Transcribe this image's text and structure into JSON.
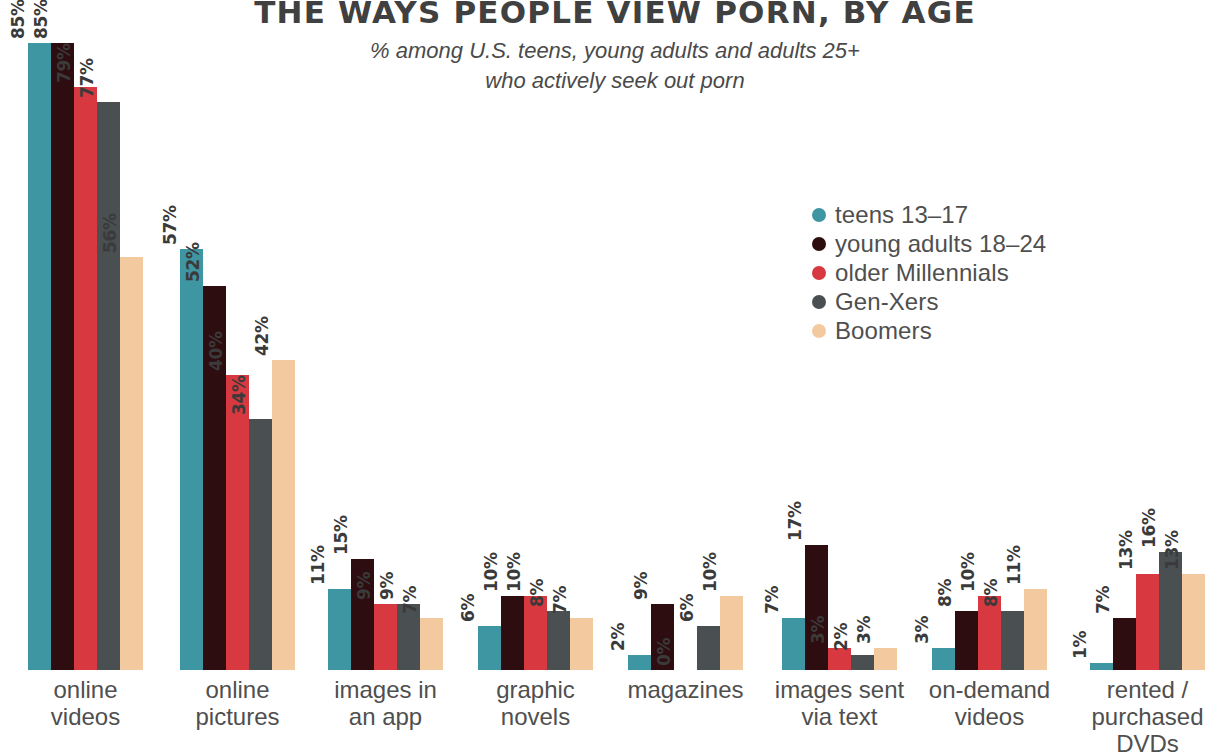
{
  "header": {
    "title": "THE WAYS PEOPLE VIEW PORN, BY AGE",
    "subtitle_line1": "% among U.S. teens, young adults and adults 25+",
    "subtitle_line2": "who actively seek out porn"
  },
  "chart_data": {
    "type": "bar",
    "title": "THE WAYS PEOPLE VIEW PORN, BY AGE",
    "subtitle": "% among U.S. teens, young adults and adults 25+ who actively seek out porn",
    "xlabel": "",
    "ylabel": "",
    "ylim": [
      0,
      85
    ],
    "grid": false,
    "legend_position": "center-right",
    "value_suffix": "%",
    "categories": [
      "online videos",
      "online pictures",
      "images in an app",
      "graphic novels",
      "magazines",
      "images sent via text",
      "on-demand videos",
      "rented / purchased DVDs"
    ],
    "category_lines": [
      [
        "online",
        "videos"
      ],
      [
        "online",
        "pictures"
      ],
      [
        "images in",
        "an app"
      ],
      [
        "graphic",
        "novels"
      ],
      [
        "magazines"
      ],
      [
        "images sent",
        "via text"
      ],
      [
        "on-demand",
        "videos"
      ],
      [
        "rented /",
        "purchased",
        "DVDs"
      ]
    ],
    "series": [
      {
        "name": "teens 13–17",
        "color": "#3f96a3",
        "values": [
          85,
          57,
          11,
          6,
          2,
          7,
          3,
          1
        ]
      },
      {
        "name": "young adults 18–24",
        "color": "#2d0d10",
        "values": [
          85,
          52,
          15,
          10,
          9,
          17,
          8,
          7
        ]
      },
      {
        "name": "older Millennials",
        "color": "#d8383f",
        "values": [
          79,
          40,
          9,
          10,
          0,
          3,
          10,
          13
        ]
      },
      {
        "name": "Gen-Xers",
        "color": "#4a4f52",
        "values": [
          77,
          34,
          9,
          8,
          6,
          2,
          8,
          16
        ]
      },
      {
        "name": "Boomers",
        "color": "#f3c9a0",
        "values": [
          56,
          42,
          7,
          7,
          10,
          3,
          11,
          13
        ]
      }
    ],
    "labels": [
      [
        "85%",
        "85%",
        "79%",
        "77%",
        "56%"
      ],
      [
        "57%",
        "52%",
        "40%",
        "34%",
        "42%"
      ],
      [
        "11%",
        "15%",
        "9%",
        "9%",
        "7%"
      ],
      [
        "6%",
        "10%",
        "10%",
        "8%",
        "7%"
      ],
      [
        "2%",
        "9%",
        "0%",
        "6%",
        "10%"
      ],
      [
        "7%",
        "17%",
        "3%",
        "2%",
        "3%"
      ],
      [
        "3%",
        "8%",
        "10%",
        "8%",
        "11%"
      ],
      [
        "1%",
        "7%",
        "13%",
        "16%",
        "13%"
      ]
    ]
  }
}
